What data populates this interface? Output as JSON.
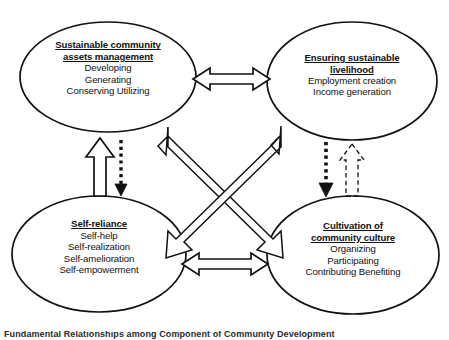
{
  "diagram": {
    "background_color": "#ffffff",
    "stroke_color": "#111111",
    "nodes": [
      {
        "id": "assets",
        "heading": [
          "Sustainable community",
          "assets management"
        ],
        "lines": [
          "Developing",
          "Generating",
          "Conserving Utilizing"
        ]
      },
      {
        "id": "livelihood",
        "heading": [
          "Ensuring sustainable",
          "livelihood"
        ],
        "lines": [
          "Employment creation",
          "Income generation"
        ]
      },
      {
        "id": "selfreliance",
        "heading": [
          "Self-reliance"
        ],
        "lines": [
          "Self-help",
          "Self-realization",
          "Self-amelioration",
          "Self-empowerment"
        ]
      },
      {
        "id": "culture",
        "heading": [
          "Cultivation of",
          "community culture"
        ],
        "lines": [
          "Organizing",
          "Participating",
          "Contributing Benefiting"
        ]
      }
    ],
    "connectors": [
      {
        "id": "top-horizontal",
        "style": "hollow",
        "heads": "double",
        "from": "assets",
        "to": "livelihood"
      },
      {
        "id": "bottom-horizontal",
        "style": "hollow",
        "heads": "double",
        "from": "selfreliance",
        "to": "culture"
      },
      {
        "id": "left-up",
        "style": "hollow",
        "heads": "single",
        "from": "selfreliance",
        "to": "assets"
      },
      {
        "id": "left-down",
        "style": "dotted",
        "heads": "single",
        "from": "assets",
        "to": "selfreliance"
      },
      {
        "id": "right-down",
        "style": "dotted",
        "heads": "single",
        "from": "livelihood",
        "to": "culture"
      },
      {
        "id": "right-up",
        "style": "dashed",
        "heads": "single",
        "from": "culture",
        "to": "livelihood"
      },
      {
        "id": "diagonal-up-left",
        "style": "hollow",
        "heads": "single",
        "from": "culture",
        "to": "assets"
      },
      {
        "id": "diagonal-up-right",
        "style": "hollow",
        "heads": "single",
        "from": "selfreliance",
        "to": "livelihood"
      }
    ]
  },
  "caption": {
    "text": "Fundamental Relationships among Component of Community Development"
  }
}
